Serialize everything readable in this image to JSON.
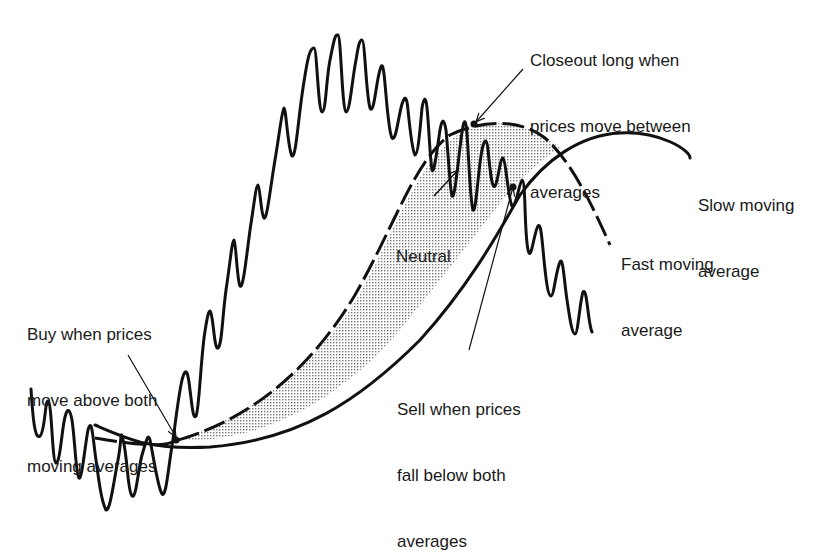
{
  "diagram": {
    "colors": {
      "ink": "#111111",
      "background": "#ffffff",
      "shade": "#888888"
    },
    "series": [
      {
        "name": "Price",
        "style": "solid-wavy"
      },
      {
        "name": "Fast moving average",
        "style": "dashed"
      },
      {
        "name": "Slow moving average",
        "style": "solid"
      }
    ],
    "regions": [
      {
        "name": "Neutral",
        "fill": "stippled",
        "between": [
          "Fast moving average",
          "Slow moving average"
        ]
      }
    ]
  },
  "labels": {
    "closeout": [
      "Closeout long when",
      "prices move between",
      "averages"
    ],
    "slow": [
      "Slow moving",
      "average"
    ],
    "fast": [
      "Fast moving",
      "average"
    ],
    "neutral": "Neutral",
    "buy": [
      "Buy when prices",
      "move above both",
      "moving averages"
    ],
    "sell": [
      "Sell when prices",
      "fall below both",
      "averages"
    ]
  }
}
